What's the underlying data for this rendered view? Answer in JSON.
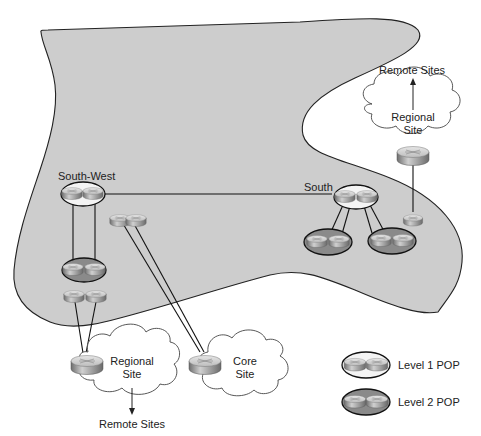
{
  "diagram": {
    "colors": {
      "backbone_fill": "#cfcfcf",
      "outline": "#222222",
      "level1_fill": "#f4f4f4",
      "level2_fill": "#8a8a8a",
      "router_top": "#d8d8d8",
      "router_side": "#8c8c8c"
    },
    "regions": {
      "south_west": {
        "label": "South-West"
      },
      "south": {
        "label": "South"
      }
    },
    "clouds": {
      "regional_top": {
        "line1": "Regional",
        "line2": "Site",
        "arrow_label": "Remote Sites"
      },
      "regional_bottom": {
        "line1": "Regional",
        "line2": "Site",
        "arrow_label": "Remote Sites"
      },
      "core": {
        "line1": "Core",
        "line2": "Site"
      }
    },
    "legend": {
      "items": [
        {
          "label": "Level 1 POP",
          "type": "level1"
        },
        {
          "label": "Level 2 POP",
          "type": "level2"
        }
      ]
    },
    "nodes": [
      {
        "id": "sw-l1-pop",
        "type": "level1",
        "region": "South-West"
      },
      {
        "id": "sw-l2-pop",
        "type": "level2",
        "region": "South-West"
      },
      {
        "id": "sw-router-pair-core",
        "type": "router-pair"
      },
      {
        "id": "sw-router-pair-regional",
        "type": "router-pair"
      },
      {
        "id": "s-l1-pop",
        "type": "level1",
        "region": "South"
      },
      {
        "id": "s-l2-pop-left",
        "type": "level2",
        "region": "South"
      },
      {
        "id": "s-l2-pop-right",
        "type": "level2",
        "region": "South"
      },
      {
        "id": "s-router-regional",
        "type": "router"
      },
      {
        "id": "regional-top-router",
        "type": "router"
      },
      {
        "id": "regional-bottom-router",
        "type": "router"
      },
      {
        "id": "core-router",
        "type": "router"
      }
    ],
    "edges": [
      [
        "sw-l1-pop",
        "s-l1-pop"
      ],
      [
        "sw-l1-pop",
        "sw-l2-pop"
      ],
      [
        "sw-l1-pop",
        "sw-l2-pop"
      ],
      [
        "sw-router-pair-core",
        "core-router"
      ],
      [
        "sw-router-pair-core",
        "core-router"
      ],
      [
        "sw-router-pair-regional",
        "regional-bottom-router"
      ],
      [
        "sw-router-pair-regional",
        "regional-bottom-router"
      ],
      [
        "s-l1-pop",
        "s-l2-pop-left"
      ],
      [
        "s-l1-pop",
        "s-l2-pop-left"
      ],
      [
        "s-l1-pop",
        "s-l2-pop-right"
      ],
      [
        "s-l1-pop",
        "s-l2-pop-right"
      ],
      [
        "s-router-regional",
        "regional-top-router"
      ]
    ]
  }
}
